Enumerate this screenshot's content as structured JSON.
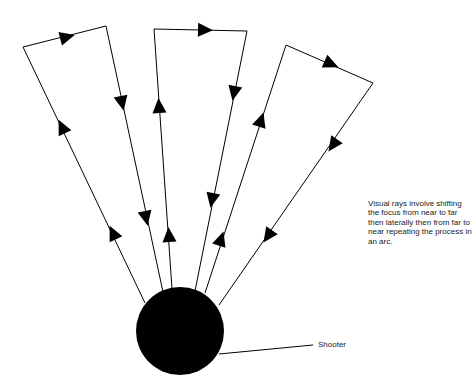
{
  "diagram": {
    "caption": "Visual rays involve shifting the focus from near to far then laterally then from far to near repeating the process in an arc.",
    "shooter_label": "Shooter",
    "colors": {
      "stroke": "#000000",
      "fill": "#000000",
      "background": "#ffffff"
    },
    "shooter": {
      "cx": 180,
      "cy": 331,
      "r": 44
    },
    "rays": [
      {
        "name": "left-loop",
        "points": [
          [
            145,
            303
          ],
          [
            23,
            47
          ],
          [
            106,
            26
          ],
          [
            163,
            292
          ]
        ]
      },
      {
        "name": "middle-loop",
        "points": [
          [
            172,
            289
          ],
          [
            154,
            29
          ],
          [
            247,
            31
          ],
          [
            195,
            291
          ]
        ]
      },
      {
        "name": "right-loop",
        "points": [
          [
            205,
            293
          ],
          [
            286,
            45
          ],
          [
            373,
            83
          ],
          [
            219,
            305
          ]
        ]
      }
    ],
    "arrows": [
      {
        "x": 113,
        "y": 233,
        "dir": "up-left"
      },
      {
        "x": 62,
        "y": 127,
        "dir": "up-left"
      },
      {
        "x": 67,
        "y": 37,
        "dir": "right"
      },
      {
        "x": 122,
        "y": 103,
        "dir": "down"
      },
      {
        "x": 146,
        "y": 218,
        "dir": "down"
      },
      {
        "x": 169,
        "y": 235,
        "dir": "up"
      },
      {
        "x": 159,
        "y": 106,
        "dir": "up"
      },
      {
        "x": 205,
        "y": 30,
        "dir": "right"
      },
      {
        "x": 234,
        "y": 93,
        "dir": "down"
      },
      {
        "x": 212,
        "y": 200,
        "dir": "down"
      },
      {
        "x": 221,
        "y": 239,
        "dir": "up"
      },
      {
        "x": 261,
        "y": 120,
        "dir": "up"
      },
      {
        "x": 331,
        "y": 64,
        "dir": "right-down"
      },
      {
        "x": 333,
        "y": 145,
        "dir": "down-left"
      },
      {
        "x": 268,
        "y": 236,
        "dir": "down-left"
      }
    ]
  }
}
